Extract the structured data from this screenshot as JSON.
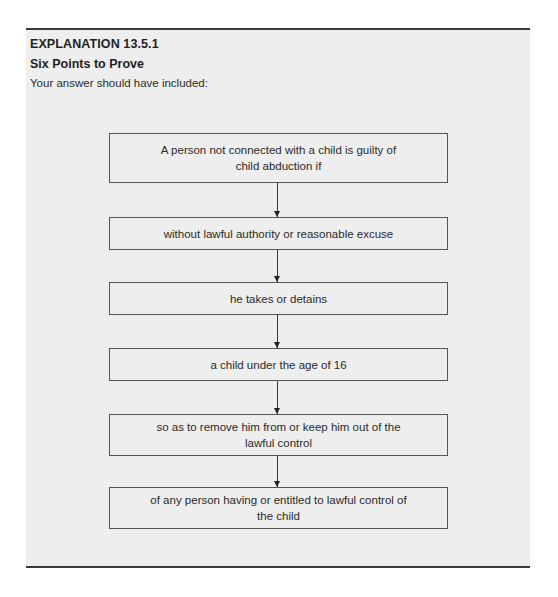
{
  "explanation": {
    "heading": "EXPLANATION 13.5.1",
    "subheading": "Six Points to Prove",
    "intro": "Your answer should have included:"
  },
  "flowchart": {
    "steps": [
      {
        "text": "A person not connected with a child is guilty of child abduction if"
      },
      {
        "text": "without lawful authority or reasonable excuse"
      },
      {
        "text": "he takes or detains"
      },
      {
        "text": "a child under the age of 16"
      },
      {
        "text": "so as to remove him from or keep him out of the lawful control"
      },
      {
        "text": "of any person having or entitled to lawful control of the child"
      }
    ]
  },
  "colors": {
    "panel_background": "#eeeeee",
    "rule": "#3a3a3a",
    "box_border": "#555555"
  }
}
